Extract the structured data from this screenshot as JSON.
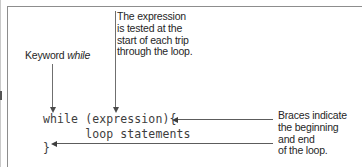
{
  "figure": {
    "background_color": "#ffffff",
    "rule_color": "#8d8d8d",
    "text_color": "#262626",
    "code_color": "#3d3d3d",
    "arrow_color": "#5c5c5c"
  },
  "code": {
    "line1": "while (expression){",
    "line2": "      loop statements",
    "line3": "}",
    "full": "while (expression){\n      loop statements\n}"
  },
  "annotations": {
    "keyword": {
      "prefix": "Keyword ",
      "emphasis": "while",
      "full": "Keyword while"
    },
    "expression": {
      "line1": "The expression",
      "line2": "is tested at the",
      "line3": "start of each trip",
      "line4": "through the loop.",
      "full": "The expression is tested at the start of each trip through the loop."
    },
    "braces": {
      "line1": "Braces indicate",
      "line2": "the beginning",
      "line3": "and end",
      "line4": "of the loop.",
      "full": "Braces indicate the beginning and end of the loop."
    }
  }
}
